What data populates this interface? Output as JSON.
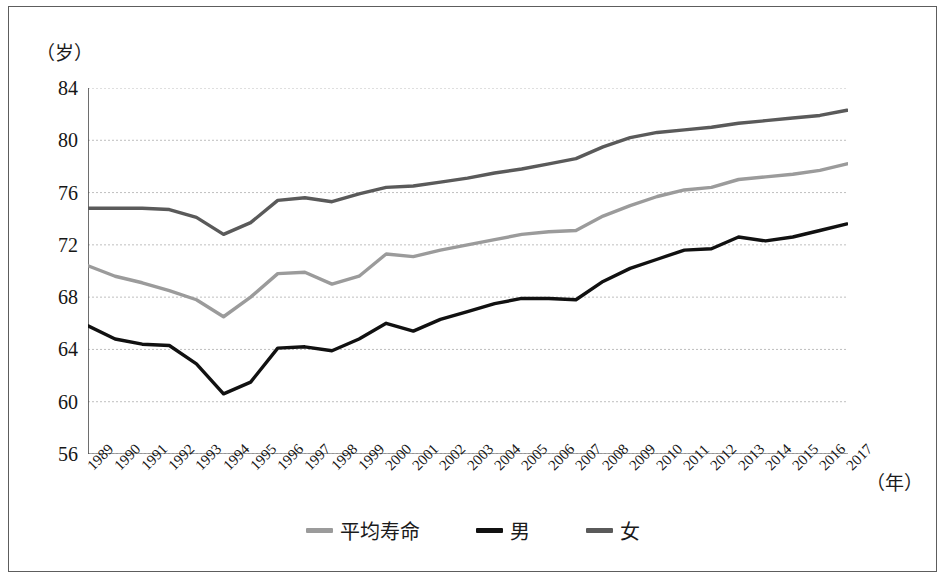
{
  "figure": {
    "y_axis_unit": "（岁）",
    "x_axis_unit": "（年）",
    "frame_color": "#5d5d5d",
    "background": "#ffffff"
  },
  "legend": {
    "position": "bottom-center",
    "items": [
      {
        "label": "平均寿命",
        "color": "#9b9b9b",
        "key": "average"
      },
      {
        "label": "男",
        "color": "#111111",
        "key": "male"
      },
      {
        "label": "女",
        "color": "#5a5a5a",
        "key": "female"
      }
    ]
  },
  "chart_data": {
    "type": "line",
    "title": "",
    "subtitle": "",
    "xlabel": "（年）",
    "ylabel": "（岁）",
    "xlim": [
      1989,
      2017
    ],
    "ylim": [
      56,
      84
    ],
    "grid": true,
    "y_ticks": [
      56,
      60,
      64,
      68,
      72,
      76,
      80,
      84
    ],
    "legend_position": "bottom-center",
    "x": [
      1989,
      1990,
      1991,
      1992,
      1993,
      1994,
      1995,
      1996,
      1997,
      1998,
      1999,
      2000,
      2001,
      2002,
      2003,
      2004,
      2005,
      2006,
      2007,
      2008,
      2009,
      2010,
      2011,
      2012,
      2013,
      2014,
      2015,
      2016,
      2017
    ],
    "categories": [
      "1989",
      "1990",
      "1991",
      "1992",
      "1993",
      "1994",
      "1995",
      "1996",
      "1997",
      "1998",
      "1999",
      "2000",
      "2001",
      "2002",
      "2003",
      "2004",
      "2005",
      "2006",
      "2007",
      "2008",
      "2009",
      "2010",
      "2011",
      "2012",
      "2013",
      "2014",
      "2015",
      "2016",
      "2017"
    ],
    "series": [
      {
        "name": "平均寿命",
        "key": "average",
        "color": "#9b9b9b",
        "values": [
          70.4,
          69.6,
          69.1,
          68.5,
          67.8,
          66.5,
          68.0,
          69.8,
          69.9,
          69.0,
          69.6,
          71.3,
          71.1,
          71.6,
          72.0,
          72.4,
          72.8,
          73.0,
          73.1,
          74.2,
          75.0,
          75.7,
          76.2,
          76.4,
          77.0,
          77.2,
          77.4,
          77.7,
          78.2
        ]
      },
      {
        "name": "男",
        "key": "male",
        "color": "#111111",
        "values": [
          65.8,
          64.8,
          64.4,
          64.3,
          62.9,
          60.6,
          61.5,
          64.1,
          64.2,
          63.9,
          64.8,
          66.0,
          65.4,
          66.3,
          66.9,
          67.5,
          67.9,
          67.9,
          67.8,
          69.2,
          70.2,
          70.9,
          71.6,
          71.7,
          72.6,
          72.3,
          72.6,
          73.1,
          73.6
        ]
      },
      {
        "name": "女",
        "key": "female",
        "color": "#5a5a5a",
        "values": [
          74.8,
          74.8,
          74.8,
          74.7,
          74.1,
          72.8,
          73.7,
          75.4,
          75.6,
          75.3,
          75.9,
          76.4,
          76.5,
          76.8,
          77.1,
          77.5,
          77.8,
          78.2,
          78.6,
          79.5,
          80.2,
          80.6,
          80.8,
          81.0,
          81.3,
          81.5,
          81.7,
          81.9,
          82.3
        ]
      }
    ]
  }
}
